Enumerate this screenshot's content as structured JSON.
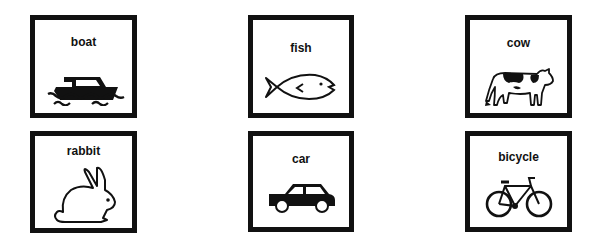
{
  "cards": [
    {
      "label": "boat",
      "icon": "boat-icon"
    },
    {
      "label": "fish",
      "icon": "fish-icon"
    },
    {
      "label": "cow",
      "icon": "cow-icon"
    },
    {
      "label": "rabbit",
      "icon": "rabbit-icon"
    },
    {
      "label": "car",
      "icon": "car-icon"
    },
    {
      "label": "bicycle",
      "icon": "bicycle-icon"
    }
  ]
}
